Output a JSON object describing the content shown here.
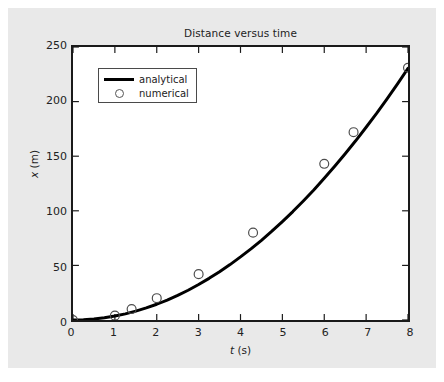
{
  "figure": {
    "background_color": "#e9e9e9",
    "plot_background_color": "#ffffff",
    "frame_color": "#1a1a1a"
  },
  "chart_data": {
    "type": "line",
    "title": "Distance versus time",
    "xlabel": "t (s)",
    "xlabel_symbol": "t",
    "xlabel_unit": "(s)",
    "ylabel": "x (m)",
    "ylabel_symbol": "x",
    "ylabel_unit": "(m)",
    "xlim": [
      0,
      8
    ],
    "ylim": [
      0,
      250
    ],
    "xticks": [
      0,
      1,
      2,
      3,
      4,
      5,
      6,
      7,
      8
    ],
    "yticks": [
      0,
      50,
      100,
      150,
      200,
      250
    ],
    "xticklabels": [
      "0",
      "1",
      "2",
      "3",
      "4",
      "5",
      "6",
      "7",
      "8"
    ],
    "yticklabels": [
      "0",
      "50",
      "100",
      "150",
      "200",
      "250"
    ],
    "grid": false,
    "tick_direction": "in",
    "ticks_all_sides": true,
    "legend_position": "upper left",
    "series": [
      {
        "name": "analytical",
        "style": "line",
        "color": "#000000",
        "linewidth": 3,
        "x": [
          0.0,
          0.25,
          0.5,
          0.75,
          1.0,
          1.25,
          1.5,
          1.75,
          2.0,
          2.25,
          2.5,
          2.75,
          3.0,
          3.25,
          3.5,
          3.75,
          4.0,
          4.25,
          4.5,
          4.75,
          5.0,
          5.25,
          5.5,
          5.75,
          6.0,
          6.25,
          6.5,
          6.75,
          7.0,
          7.25,
          7.5,
          7.75,
          8.0
        ],
        "y": [
          0.0,
          0.23,
          0.9,
          2.03,
          3.61,
          5.63,
          8.11,
          11.04,
          14.42,
          18.25,
          22.56,
          27.26,
          32.49,
          38.12,
          44.21,
          50.76,
          57.76,
          65.11,
          73.01,
          81.32,
          90.13,
          99.28,
          109.0,
          119.1,
          129.8,
          140.8,
          152.3,
          164.1,
          176.5,
          189.2,
          202.5,
          216.2,
          230.4
        ]
      },
      {
        "name": "numerical",
        "style": "markers",
        "marker": "circle-open",
        "color": "#4d4d4d",
        "markersize": 9,
        "x": [
          0.0,
          1.0,
          1.4,
          2.0,
          3.0,
          4.3,
          6.0,
          6.7,
          8.0
        ],
        "y": [
          0.0,
          4.0,
          10.0,
          20.0,
          42.0,
          80.0,
          143.0,
          172.0,
          231.0
        ]
      }
    ],
    "legend_entries": [
      {
        "label": "analytical",
        "key": "line"
      },
      {
        "label": "numerical",
        "key": "circle-open"
      }
    ]
  }
}
